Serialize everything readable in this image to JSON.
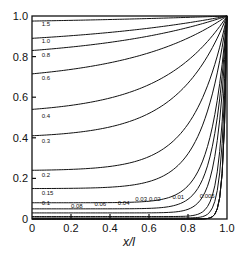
{
  "chart_data": {
    "type": "line",
    "title": "",
    "xlabel": "x/l",
    "ylabel": "",
    "xlim": [
      0,
      1.0
    ],
    "ylim": [
      0,
      1.0
    ],
    "grid": false,
    "legend": "none",
    "x_ticks": [
      "0",
      "0.2",
      "0.4",
      "0.6",
      "0.8",
      "1.0"
    ],
    "y_ticks": [
      "0",
      "0.2",
      "0.4",
      "0.6",
      "0.8",
      "1.0"
    ],
    "note": "Family of curves all converging to (1.0, 1.0); each curve labeled by parameter value",
    "series": [
      {
        "name": "1.5",
        "y_at_x0": 0.975,
        "label_pos": [
          0.05,
          0.95
        ]
      },
      {
        "name": "1.0",
        "y_at_x0": 0.89,
        "label_pos": [
          0.05,
          0.865
        ]
      },
      {
        "name": "0.8",
        "y_at_x0": 0.83,
        "label_pos": [
          0.05,
          0.8
        ]
      },
      {
        "name": "0.6",
        "y_at_x0": 0.715,
        "label_pos": [
          0.05,
          0.685
        ]
      },
      {
        "name": "0.4",
        "y_at_x0": 0.54,
        "label_pos": [
          0.05,
          0.5
        ]
      },
      {
        "name": "0.3",
        "y_at_x0": 0.41,
        "label_pos": [
          0.05,
          0.375
        ]
      },
      {
        "name": "0.2",
        "y_at_x0": 0.24,
        "label_pos": [
          0.05,
          0.205
        ]
      },
      {
        "name": "0.15",
        "y_at_x0": 0.15,
        "label_pos": [
          0.05,
          0.12
        ]
      },
      {
        "name": "0.1",
        "y_at_x0": 0.08,
        "label_pos": [
          0.05,
          0.07
        ]
      },
      {
        "name": "0.08",
        "y_at_x0": 0.05,
        "label_pos": [
          0.2,
          0.055
        ]
      },
      {
        "name": "0.06",
        "y_at_x0": 0.03,
        "label_pos": [
          0.32,
          0.065
        ]
      },
      {
        "name": "0.04",
        "y_at_x0": 0.012,
        "label_pos": [
          0.44,
          0.07
        ]
      },
      {
        "name": "0.03",
        "y_at_x0": 0.005,
        "label_pos": [
          0.53,
          0.09
        ]
      },
      {
        "name": "0.02",
        "y_at_x0": 0.0,
        "label_pos": [
          0.6,
          0.09
        ]
      },
      {
        "name": "0.01",
        "y_at_x0": 0.0,
        "label_pos": [
          0.72,
          0.1
        ]
      },
      {
        "name": "0.005",
        "y_at_x0": 0.0,
        "label_pos": [
          0.86,
          0.105
        ]
      }
    ]
  }
}
